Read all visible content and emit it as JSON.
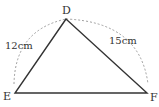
{
  "diagram": {
    "type": "triangle",
    "vertices": {
      "D": {
        "label": "D",
        "x": 66,
        "y": 19
      },
      "E": {
        "label": "E",
        "x": 15,
        "y": 93
      },
      "F": {
        "label": "F",
        "x": 147,
        "y": 93
      }
    },
    "sides": {
      "DE": {
        "label": "12cm"
      },
      "DF": {
        "label": "15cm"
      }
    },
    "colors": {
      "line": "#333333",
      "dashed": "#888888"
    }
  }
}
